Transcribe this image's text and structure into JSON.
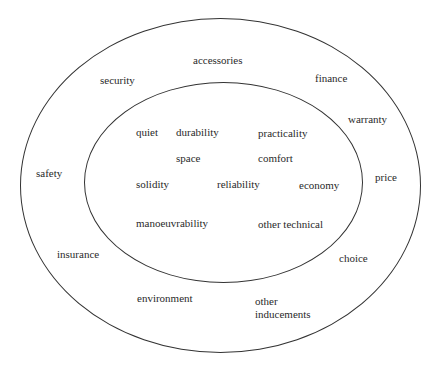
{
  "diagram": {
    "type": "concentric-circles",
    "outer_ring": {
      "label": "outer",
      "items": [
        {
          "text": "accessories",
          "x": 193,
          "y": 54
        },
        {
          "text": "security",
          "x": 100,
          "y": 74
        },
        {
          "text": "finance",
          "x": 315,
          "y": 72
        },
        {
          "text": "warranty",
          "x": 348,
          "y": 113
        },
        {
          "text": "safety",
          "x": 36,
          "y": 167
        },
        {
          "text": "price",
          "x": 375,
          "y": 171
        },
        {
          "text": "insurance",
          "x": 57,
          "y": 248
        },
        {
          "text": "choice",
          "x": 339,
          "y": 252
        },
        {
          "text": "environment",
          "x": 137,
          "y": 292
        },
        {
          "text": "other",
          "x": 255,
          "y": 295
        },
        {
          "text": "inducements",
          "x": 255,
          "y": 308
        }
      ]
    },
    "inner_ring": {
      "label": "inner",
      "items": [
        {
          "text": "quiet",
          "x": 136,
          "y": 126
        },
        {
          "text": "durability",
          "x": 176,
          "y": 126
        },
        {
          "text": "practicality",
          "x": 258,
          "y": 127
        },
        {
          "text": "space",
          "x": 176,
          "y": 152
        },
        {
          "text": "comfort",
          "x": 258,
          "y": 152
        },
        {
          "text": "solidity",
          "x": 136,
          "y": 178
        },
        {
          "text": "reliability",
          "x": 217,
          "y": 178
        },
        {
          "text": "economy",
          "x": 299,
          "y": 179
        },
        {
          "text": "manoeuvrability",
          "x": 136,
          "y": 217
        },
        {
          "text": "other technical",
          "x": 258,
          "y": 218
        }
      ]
    },
    "colors": {
      "line": "#333333",
      "text": "#2a2a2a",
      "background": "#ffffff"
    }
  }
}
